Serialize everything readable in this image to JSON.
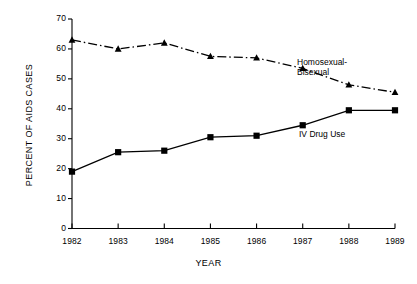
{
  "chart_data": {
    "type": "line",
    "title": "",
    "xlabel": "YEAR",
    "ylabel": "PERCENT OF AIDS CASES",
    "categories": [
      "1982",
      "1983",
      "1984",
      "1985",
      "1986",
      "1987",
      "1988",
      "1989"
    ],
    "x": [
      1982,
      1983,
      1984,
      1985,
      1986,
      1987,
      1988,
      1989
    ],
    "xlim": [
      1982,
      1989
    ],
    "ylim": [
      0,
      70
    ],
    "y_ticks": [
      0,
      10,
      20,
      30,
      40,
      50,
      60,
      70
    ],
    "x_ticks": [
      "1982",
      "1983",
      "1984",
      "1985",
      "1986",
      "1987",
      "1988",
      "1989"
    ],
    "grid": false,
    "legend_position": "inline-annotation",
    "series": [
      {
        "name": "Homosexual-Bisexual",
        "values": [
          63,
          60,
          62,
          57.5,
          57,
          53.5,
          48,
          45.5
        ],
        "marker": "triangle",
        "linestyle": "dash-dot",
        "color": "#000000"
      },
      {
        "name": "IV Drug Use",
        "values": [
          19,
          25.5,
          26,
          30.5,
          31,
          34.5,
          39.5,
          39.5
        ],
        "marker": "square",
        "linestyle": "solid",
        "color": "#000000"
      }
    ],
    "annotations": [
      {
        "text_line1": "Homosexual-",
        "text_line2": "Bisexual"
      },
      {
        "text_line1": "IV Drug Use",
        "text_line2": ""
      }
    ]
  },
  "axis": {
    "y_title": "PERCENT OF AIDS CASES",
    "x_title": "YEAR",
    "y_ticks": [
      "0",
      "10",
      "20",
      "30",
      "40",
      "50",
      "60",
      "70"
    ],
    "x_ticks": [
      "1982",
      "1983",
      "1984",
      "1985",
      "1986",
      "1987",
      "1988",
      "1989"
    ]
  },
  "labels": {
    "homosexual_bisexual_line1": "Homosexual-",
    "homosexual_bisexual_line2": "Bisexual",
    "iv_drug_use": "IV Drug Use"
  }
}
